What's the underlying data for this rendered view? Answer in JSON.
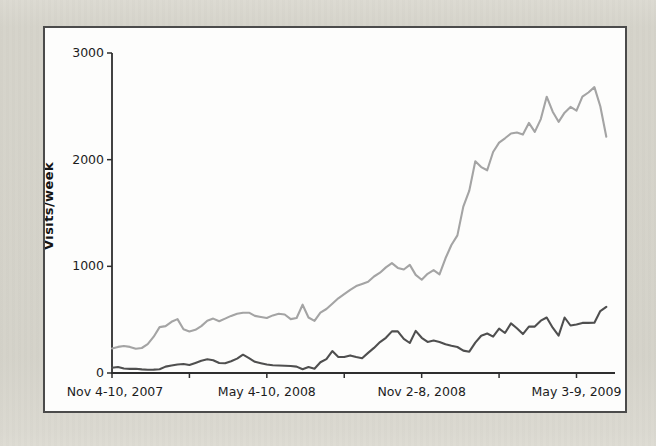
{
  "figure": {
    "background_color": "#eae9e4",
    "panel_background": "#fdfdfc",
    "panel_border_color": "#4b4b4b",
    "axis_color": "#2e2e2e",
    "tick_label_color": "#1c1c1c"
  },
  "chart_data": {
    "type": "line",
    "title": "",
    "xlabel": "",
    "ylabel": "Visits/week",
    "ylim": [
      0,
      3000
    ],
    "y_ticks": [
      0,
      1000,
      2000,
      3000
    ],
    "x_unit": "week",
    "x_tick_weeks": [
      0,
      13,
      26,
      39,
      52,
      65,
      78
    ],
    "x_label_weeks": [
      0,
      26,
      52,
      78
    ],
    "x_labels": [
      "Nov 4-10, 2007",
      "May 4-10, 2008",
      "Nov 2-8, 2008",
      "May 3-9, 2009"
    ],
    "grid": false,
    "legend": "none",
    "series": [
      {
        "name": "light-gray-series",
        "color": "#a4a4a4",
        "values": [
          230,
          245,
          253,
          245,
          228,
          234,
          270,
          340,
          430,
          440,
          480,
          505,
          410,
          390,
          405,
          440,
          490,
          510,
          485,
          510,
          535,
          555,
          565,
          565,
          535,
          525,
          516,
          540,
          555,
          548,
          505,
          516,
          640,
          520,
          488,
          565,
          600,
          650,
          700,
          740,
          780,
          815,
          835,
          855,
          905,
          940,
          990,
          1030,
          985,
          970,
          1013,
          920,
          875,
          930,
          965,
          925,
          1075,
          1200,
          1290,
          1560,
          1710,
          1985,
          1930,
          1900,
          2072,
          2160,
          2200,
          2245,
          2255,
          2235,
          2345,
          2260,
          2380,
          2590,
          2450,
          2355,
          2440,
          2495,
          2460,
          2590,
          2630,
          2680,
          2500,
          2215
        ]
      },
      {
        "name": "dark-gray-series",
        "color": "#505050",
        "values": [
          50,
          56,
          42,
          38,
          40,
          34,
          30,
          32,
          36,
          60,
          70,
          80,
          84,
          75,
          95,
          115,
          128,
          120,
          94,
          92,
          110,
          135,
          172,
          140,
          105,
          92,
          80,
          72,
          70,
          68,
          66,
          60,
          35,
          55,
          40,
          100,
          130,
          205,
          150,
          150,
          165,
          150,
          138,
          188,
          235,
          290,
          330,
          390,
          390,
          320,
          281,
          395,
          330,
          292,
          305,
          292,
          270,
          255,
          244,
          210,
          200,
          285,
          350,
          370,
          340,
          415,
          375,
          465,
          420,
          365,
          435,
          435,
          490,
          520,
          425,
          350,
          520,
          445,
          455,
          470,
          470,
          472,
          580,
          620
        ]
      }
    ]
  }
}
